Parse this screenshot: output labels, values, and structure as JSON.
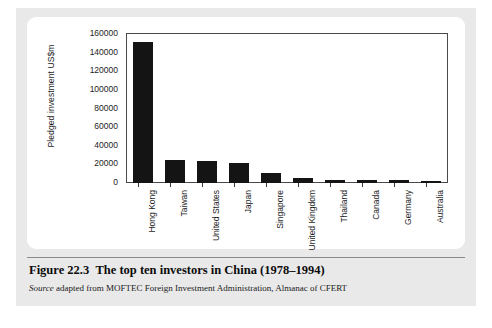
{
  "figure": {
    "caption_label": "Figure 22.3",
    "caption_title": "The top ten investors in China (1978–1994)",
    "source_word": "Source",
    "source_text": " adapted from MOFTEC Foreign Investment Administration, Almanac of CFERT"
  },
  "chart_data": {
    "type": "bar",
    "title": "",
    "xlabel": "",
    "ylabel": "Pledged investment US$m",
    "ylim": [
      0,
      160000
    ],
    "ytick_labels": [
      "160000",
      "140000",
      "120000",
      "100000",
      "80000",
      "60000",
      "40000",
      "20000",
      "0"
    ],
    "yticks": [
      160000,
      140000,
      120000,
      100000,
      80000,
      60000,
      40000,
      20000,
      0
    ],
    "grid": false,
    "legend": "none",
    "bar_color": "#141414",
    "categories": [
      "Hong Kong",
      "Taiwan",
      "United States",
      "Japan",
      "Singapore",
      "United Kingdom",
      "Thailand",
      "Canada",
      "Germany",
      "Australia"
    ],
    "values": [
      151000,
      25000,
      24000,
      21000,
      11000,
      5000,
      3500,
      3000,
      2800,
      2500
    ]
  }
}
